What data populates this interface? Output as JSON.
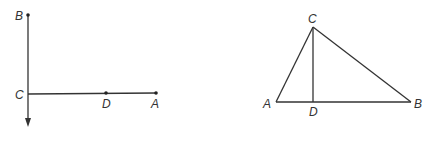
{
  "figures": [
    {
      "name": "left-figure",
      "labels": {
        "B": "B",
        "C": "C",
        "D": "D",
        "A": "A"
      }
    },
    {
      "name": "right-figure",
      "labels": {
        "C": "C",
        "A": "A",
        "D": "D",
        "B": "B"
      }
    }
  ],
  "colors": {
    "stroke": "#333333",
    "background": "#ffffff"
  }
}
